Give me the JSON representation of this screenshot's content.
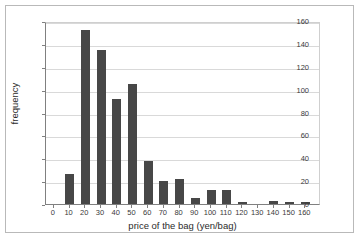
{
  "chart_data": {
    "type": "bar",
    "title": "",
    "subtitle": "",
    "xlabel": "price of the bag (yen/bag)",
    "ylabel": "frequency",
    "categories": [
      0,
      10,
      20,
      30,
      40,
      50,
      60,
      70,
      80,
      90,
      100,
      110,
      120,
      130,
      140,
      150,
      160
    ],
    "values": [
      0,
      26,
      152,
      135,
      92,
      105,
      38,
      20,
      22,
      5,
      12,
      12,
      2,
      0,
      3,
      2,
      2
    ],
    "xlim": [
      -5,
      170
    ],
    "ylim": [
      0,
      160
    ],
    "xticks": [
      0,
      10,
      20,
      30,
      40,
      50,
      60,
      70,
      80,
      90,
      100,
      110,
      120,
      130,
      140,
      150,
      160
    ],
    "yticks": [
      0,
      20,
      40,
      60,
      80,
      100,
      120,
      140,
      160
    ],
    "grid": "horizontal",
    "legend": "none",
    "bar_color": "#474747",
    "grid_color": "#d9d9d9",
    "axis_color": "#808080",
    "background_color": "#ffffff",
    "frame_color": "#b9b9b9",
    "bin_width": 10,
    "tick_labels_y": [
      "0",
      "20",
      "40",
      "60",
      "80",
      "100",
      "120",
      "140",
      "160"
    ],
    "tick_labels_x": [
      "0",
      "10",
      "20",
      "30",
      "40",
      "50",
      "60",
      "70",
      "80",
      "90",
      "100",
      "110",
      "120",
      "130",
      "140",
      "150",
      "160"
    ]
  }
}
